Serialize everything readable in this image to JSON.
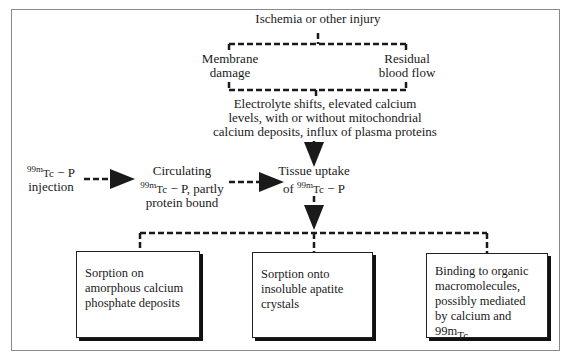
{
  "diagram": {
    "top": {
      "trigger": "Ischemia or other injury",
      "branches": [
        {
          "line1": "Membrane",
          "line2": "damage"
        },
        {
          "line1": "Residual",
          "line2": "blood flow"
        }
      ],
      "result": [
        "Electrolyte shifts, elevated calcium",
        "levels, with or without mitochondrial",
        "calcium deposits, influx of plasma proteins"
      ]
    },
    "flow": {
      "injection": {
        "iso": "99m",
        "symbol": "Tc",
        "suffix": " − P",
        "line2": "injection"
      },
      "circulating": {
        "line1": "Circulating",
        "iso": "99m",
        "symbol": "Tc",
        "suffix": " − P, partly",
        "line3": "protein bound"
      },
      "uptake": {
        "line1": "Tissue uptake",
        "prefix": "of ",
        "iso": "99m",
        "symbol": "Tc",
        "suffix": " − P"
      }
    },
    "mechanisms": [
      {
        "text": "Sorption on amorphous calcium phosphate deposits"
      },
      {
        "text": "Sorption onto insoluble apatite crystals"
      },
      {
        "text": "Binding to organic macromolecules, possibly mediated by calcium and ",
        "iso": "99m",
        "symbol": "Tc"
      }
    ],
    "colors": {
      "line": "#1a1a1a",
      "frame": "#8a8a8a"
    }
  }
}
